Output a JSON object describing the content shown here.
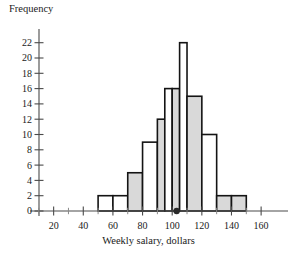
{
  "chart_data": {
    "type": "bar",
    "title": "",
    "subtitle": "",
    "xlabel": "Weekly salary, dollars",
    "ylabel": "Frequency",
    "xlim": [
      0,
      165
    ],
    "ylim": [
      0,
      22
    ],
    "grid": false,
    "legend": null,
    "bin_edges": [
      50,
      60,
      70,
      80,
      90,
      95,
      100,
      105,
      110,
      120,
      130,
      140,
      150
    ],
    "bins": [
      {
        "start": 50,
        "end": 60,
        "value": 2,
        "fill": "white"
      },
      {
        "start": 60,
        "end": 70,
        "value": 2,
        "fill": "white"
      },
      {
        "start": 70,
        "end": 80,
        "value": 5,
        "fill": "gray"
      },
      {
        "start": 80,
        "end": 90,
        "value": 9,
        "fill": "white"
      },
      {
        "start": 90,
        "end": 95,
        "value": 12,
        "fill": "gray"
      },
      {
        "start": 95,
        "end": 100,
        "value": 16,
        "fill": "white"
      },
      {
        "start": 100,
        "end": 105,
        "value": 16,
        "fill": "gray"
      },
      {
        "start": 105,
        "end": 110,
        "value": 22,
        "fill": "white"
      },
      {
        "start": 110,
        "end": 120,
        "value": 15,
        "fill": "gray"
      },
      {
        "start": 120,
        "end": 130,
        "value": 10,
        "fill": "white"
      },
      {
        "start": 130,
        "end": 140,
        "value": 2,
        "fill": "gray"
      },
      {
        "start": 140,
        "end": 150,
        "value": 2,
        "fill": "gray"
      }
    ],
    "marker": {
      "x": 103,
      "y": 0,
      "shape": "dot"
    },
    "y_ticks": [
      0,
      2,
      4,
      6,
      8,
      10,
      12,
      14,
      16,
      18,
      20,
      22
    ],
    "y_tick_labels": [
      "0",
      "2",
      "4",
      "6",
      "8",
      "10",
      "12",
      "14",
      "16",
      "18",
      "20",
      "22"
    ],
    "x_ticks_major": [
      20,
      40,
      60,
      80,
      100,
      120,
      140,
      160
    ],
    "x_tick_labels": [
      "20",
      "40",
      "60",
      "80",
      "100",
      "120",
      "140",
      "160"
    ],
    "x_ticks_minor": [
      10,
      30,
      50,
      70,
      90,
      110,
      130,
      150
    ],
    "colors": {
      "bar_fill_gray": "#d9d9d9",
      "bar_fill_white": "#ffffff",
      "bar_outline": "#141414",
      "axis": "#4a4a4a",
      "text": "#1a1a1a",
      "marker": "#2a2a2a",
      "background": "#ffffff"
    }
  }
}
